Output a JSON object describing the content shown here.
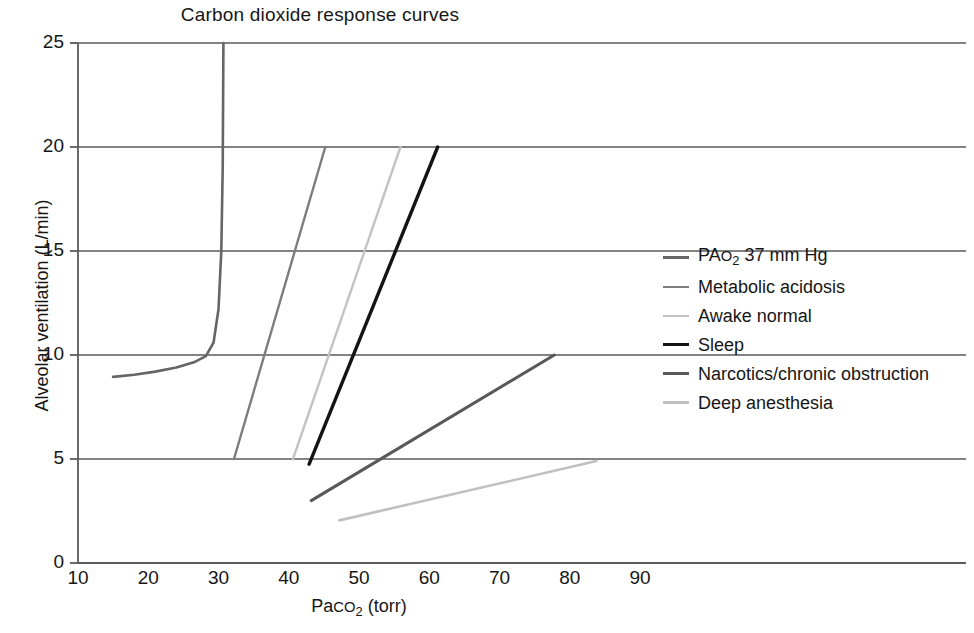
{
  "chart_data": {
    "type": "line",
    "title": "Carbon dioxide response curves",
    "xlabel_parts": {
      "pre": "P",
      "a": "a",
      "small": "CO",
      "sub": "2",
      "post": " (torr)"
    },
    "xlabel": "Paco2 (torr)",
    "ylabel": "Alveolar ventilation (L/min)",
    "xlim": [
      10,
      90
    ],
    "ylim": [
      0,
      25
    ],
    "xticks": [
      10,
      20,
      30,
      40,
      50,
      60,
      70,
      80,
      90
    ],
    "yticks": [
      0,
      5,
      10,
      15,
      20,
      25
    ],
    "grid": "horizontal gridlines at y = 5, 10, 15, 20, 25 spanning beyond plot to right edge",
    "legend_position": "right",
    "series": [
      {
        "name": "PAo2 37 mm Hg",
        "label_parts": {
          "pre": "PA",
          "small": "O",
          "sub": "2",
          "post": " 37 mm Hg"
        },
        "color": "#656565",
        "width": 2.6,
        "points": [
          [
            15.0,
            8.95
          ],
          [
            18.0,
            9.05
          ],
          [
            21.0,
            9.2
          ],
          [
            24.0,
            9.4
          ],
          [
            26.5,
            9.65
          ],
          [
            28.2,
            9.95
          ],
          [
            29.3,
            10.6
          ],
          [
            30.0,
            12.2
          ],
          [
            30.4,
            15.0
          ],
          [
            30.6,
            19.0
          ],
          [
            30.7,
            25.0
          ]
        ]
      },
      {
        "name": "Metabolic acidosis",
        "label_parts": {
          "pre": "Metabolic acidosis",
          "small": "",
          "sub": "",
          "post": ""
        },
        "color": "#7d7d7d",
        "width": 2.4,
        "points": [
          [
            32.2,
            5.0
          ],
          [
            45.2,
            20.0
          ]
        ]
      },
      {
        "name": "Awake normal",
        "label_parts": {
          "pre": "Awake normal",
          "small": "",
          "sub": "",
          "post": ""
        },
        "color": "#c3c3c3",
        "width": 2.4,
        "points": [
          [
            40.6,
            5.0
          ],
          [
            55.9,
            20.0
          ]
        ]
      },
      {
        "name": "Sleep",
        "label_parts": {
          "pre": "Sleep",
          "small": "",
          "sub": "",
          "post": ""
        },
        "color": "#141414",
        "width": 3.4,
        "points": [
          [
            42.9,
            4.75
          ],
          [
            61.2,
            20.0
          ]
        ]
      },
      {
        "name": "Narcotics/chronic obstruction",
        "label_parts": {
          "pre": "Narcotics/chronic obstruction",
          "small": "",
          "sub": "",
          "post": ""
        },
        "color": "#585858",
        "width": 3.0,
        "points": [
          [
            43.2,
            3.0
          ],
          [
            77.8,
            10.0
          ]
        ]
      },
      {
        "name": "Deep anesthesia",
        "label_parts": {
          "pre": "Deep anesthesia",
          "small": "",
          "sub": "",
          "post": ""
        },
        "color": "#c0c0c0",
        "width": 2.6,
        "points": [
          [
            47.2,
            2.05
          ],
          [
            83.8,
            4.9
          ]
        ]
      }
    ]
  },
  "axes": {
    "frame_color": "#5a5a5a",
    "y_tick_labels": [
      "25",
      "20",
      "15",
      "10",
      "5",
      "0"
    ],
    "x_tick_labels": [
      "10",
      "20",
      "30",
      "40",
      "50",
      "60",
      "70",
      "80",
      "90"
    ]
  }
}
